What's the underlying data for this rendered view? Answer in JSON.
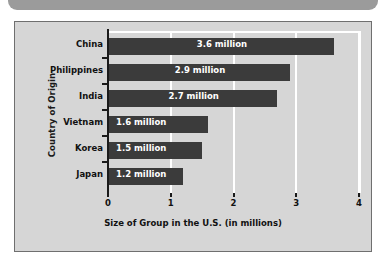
{
  "page": {
    "background_color": "#ffffff"
  },
  "top_strip": {
    "name": "cut-off-banner",
    "color": "#9b9b9b"
  },
  "chart_panel": {
    "background_color": "#d6d6d6",
    "border_color": "#6f6f6f"
  },
  "chart_data": {
    "type": "bar",
    "orientation": "horizontal",
    "title": "",
    "subtitle": "",
    "xlabel": "Size of Group in the U.S. (in millions)",
    "ylabel": "Country of Origin",
    "categories": [
      "China",
      "Philippines",
      "India",
      "Vietnam",
      "Korea",
      "Japan"
    ],
    "values": [
      3.6,
      2.9,
      2.7,
      1.6,
      1.5,
      1.2
    ],
    "value_labels": [
      "3.6 million",
      "2.9 million",
      "2.7 million",
      "1.6 million",
      "1.5 million",
      "1.2 million"
    ],
    "xlim": [
      0,
      4
    ],
    "xticks": [
      0,
      1,
      2,
      3,
      4
    ],
    "xtick_labels": [
      "0",
      "1",
      "2",
      "3",
      "4"
    ],
    "grid": "vertical-white",
    "legend": "none",
    "bar_color": "#3b3b3b",
    "value_label_color": "#ffffff",
    "gridline_color": "#ffffff"
  }
}
